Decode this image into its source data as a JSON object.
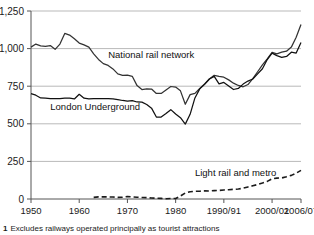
{
  "chart_data": {
    "type": "line",
    "title": "",
    "subtitle": "",
    "xlabel": "",
    "ylabel": "",
    "xlim": [
      1950,
      2006
    ],
    "ylim": [
      0,
      1250
    ],
    "grid": true,
    "legend_position": "inline-annotations",
    "y_ticks": [
      "0",
      "250",
      "500",
      "750",
      "1,000",
      "1,250"
    ],
    "y_tick_values": [
      0,
      250,
      500,
      750,
      1000,
      1250
    ],
    "x_ticks": [
      "1950",
      "1960",
      "1970",
      "1980",
      "1990/91",
      "2000/01",
      "2006/07"
    ],
    "x_tick_values": [
      1950,
      1960,
      1970,
      1980,
      1990,
      2000,
      2006
    ],
    "annotations": [
      {
        "text": "National rail network",
        "x": 1966,
        "y": 935
      },
      {
        "text": "London Underground",
        "x": 1954,
        "y": 590
      },
      {
        "text": "Light rail and metro",
        "x": 1984,
        "y": 150
      }
    ],
    "series": [
      {
        "name": "National rail network",
        "style": "solid",
        "color": "#333333",
        "x": [
          1950,
          1951,
          1952,
          1953,
          1954,
          1955,
          1956,
          1957,
          1958,
          1959,
          1960,
          1961,
          1962,
          1963,
          1964,
          1965,
          1966,
          1967,
          1968,
          1969,
          1970,
          1971,
          1972,
          1973,
          1974,
          1975,
          1976,
          1977,
          1978,
          1979,
          1980,
          1981,
          1982,
          1983,
          1984,
          1985,
          1986,
          1987,
          1988,
          1989,
          1990,
          1991,
          1992,
          1993,
          1994,
          1995,
          1996,
          1997,
          1998,
          1999,
          2000,
          2001,
          2002,
          2003,
          2004,
          2005,
          2006
        ],
        "values": [
          1010,
          1030,
          1018,
          1015,
          1020,
          995,
          1030,
          1101,
          1090,
          1065,
          1037,
          1025,
          1010,
          965,
          928,
          900,
          888,
          865,
          832,
          822,
          824,
          816,
          754,
          728,
          733,
          731,
          702,
          702,
          725,
          748,
          744,
          719,
          630,
          694,
          702,
          735,
          765,
          798,
          822,
          815,
          810,
          792,
          770,
          755,
          746,
          761,
          801,
          846,
          892,
          931,
          975,
          965,
          976,
          983,
          1010,
          1075,
          1160
        ]
      },
      {
        "name": "London Underground",
        "style": "solid",
        "color": "#111111",
        "x": [
          1950,
          1951,
          1952,
          1953,
          1954,
          1955,
          1956,
          1957,
          1958,
          1959,
          1960,
          1961,
          1962,
          1963,
          1964,
          1965,
          1966,
          1967,
          1968,
          1969,
          1970,
          1971,
          1972,
          1973,
          1974,
          1975,
          1976,
          1977,
          1978,
          1979,
          1980,
          1981,
          1982,
          1983,
          1984,
          1985,
          1986,
          1987,
          1988,
          1989,
          1990,
          1991,
          1992,
          1993,
          1994,
          1995,
          1996,
          1997,
          1998,
          1999,
          2000,
          2001,
          2002,
          2003,
          2004,
          2005,
          2006
        ],
        "values": [
          700,
          690,
          672,
          670,
          668,
          668,
          668,
          670,
          671,
          665,
          696,
          670,
          665,
          668,
          668,
          667,
          667,
          665,
          661,
          655,
          650,
          654,
          645,
          644,
          628,
          604,
          545,
          545,
          568,
          594,
          565,
          541,
          498,
          563,
          672,
          732,
          762,
          798,
          815,
          765,
          775,
          751,
          728,
          735,
          764,
          784,
          798,
          832,
          866,
          927,
          970,
          953,
          942,
          948,
          976,
          970,
          1040
        ]
      },
      {
        "name": "Light rail and metro",
        "style": "dashed",
        "color": "#1a1a1a",
        "x": [
          1963,
          1964,
          1965,
          1966,
          1967,
          1968,
          1969,
          1970,
          1971,
          1972,
          1973,
          1974,
          1975,
          1976,
          1977,
          1978,
          1979,
          1980,
          1981,
          1982,
          1983,
          1984,
          1985,
          1986,
          1987,
          1988,
          1989,
          1990,
          1991,
          1992,
          1993,
          1994,
          1995,
          1996,
          1997,
          1998,
          1999,
          2000,
          2001,
          2002,
          2003,
          2004,
          2005,
          2006
        ],
        "values": [
          11,
          14,
          14,
          14,
          13,
          11,
          12,
          16,
          14,
          12,
          10,
          9,
          7,
          5,
          4,
          2,
          3,
          3,
          20,
          40,
          48,
          52,
          52,
          54,
          53,
          56,
          57,
          60,
          62,
          64,
          66,
          72,
          80,
          88,
          96,
          106,
          117,
          134,
          139,
          140,
          148,
          157,
          172,
          190
        ]
      }
    ]
  },
  "footnote": {
    "marker": "1",
    "text": "Excludes railways operated principally as tourist attractions"
  }
}
